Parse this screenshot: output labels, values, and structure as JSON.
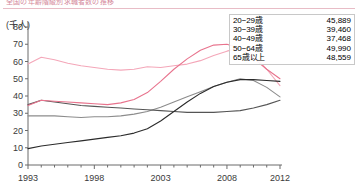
{
  "header": {
    "clipped_text": "全国の年齢階級別求職者数の推移",
    "unit_label": "(千人)"
  },
  "legend": {
    "rows": [
      {
        "label": "20−29歳",
        "value": "45,889",
        "color": "#f4a7b9"
      },
      {
        "label": "30−39歳",
        "value": "39,460",
        "color": "#8c8c8c"
      },
      {
        "label": "40−49歳",
        "value": "37,468",
        "color": "#555555"
      },
      {
        "label": "50−64歳",
        "value": "49,990",
        "color": "#e8738d"
      },
      {
        "label": "65歳以上",
        "value": "48,559",
        "color": "#2b2b2b"
      }
    ]
  },
  "chart_data": {
    "type": "line",
    "title": "",
    "xlabel": "",
    "ylabel": "(千人)",
    "ylim": [
      0,
      80
    ],
    "xlim": [
      1993,
      2012
    ],
    "ytick_values": [
      0,
      10,
      20,
      30,
      40,
      50,
      60,
      70,
      80
    ],
    "ytick_labels": [
      "0",
      "10",
      "20",
      "30",
      "40",
      "50",
      "60",
      "70",
      "80"
    ],
    "xtick_values": [
      1993,
      1998,
      2003,
      2008,
      2012
    ],
    "xtick_labels": [
      "1993",
      "1998",
      "2003",
      "2008",
      "2012"
    ],
    "minor_xticks_every": 1,
    "grid": false,
    "legend_position": "top-right",
    "x": [
      1993,
      1994,
      1995,
      1996,
      1997,
      1998,
      1999,
      2000,
      2001,
      2002,
      2003,
      2004,
      2005,
      2006,
      2007,
      2008,
      2009,
      2010,
      2011,
      2012
    ],
    "series": [
      {
        "name": "20−29歳",
        "color": "#f4a7b9",
        "final_value_label": "45,889",
        "values": [
          58.5,
          62.5,
          61.0,
          59.0,
          57.5,
          56.5,
          55.5,
          55.0,
          55.5,
          57.0,
          56.5,
          57.5,
          58.5,
          60.5,
          63.5,
          66.0,
          68.0,
          64.0,
          55.5,
          46.0
        ]
      },
      {
        "name": "30−39歳",
        "color": "#8c8c8c",
        "final_value_label": "39,460",
        "values": [
          28.5,
          28.5,
          28.5,
          28.0,
          27.5,
          28.0,
          28.0,
          28.5,
          29.5,
          31.0,
          33.5,
          36.5,
          39.5,
          42.5,
          45.5,
          48.0,
          50.0,
          49.0,
          45.0,
          39.5
        ]
      },
      {
        "name": "40−49歳",
        "color": "#555555",
        "final_value_label": "37,468",
        "values": [
          35.0,
          37.5,
          36.5,
          35.5,
          34.5,
          34.0,
          33.5,
          33.0,
          32.5,
          32.0,
          31.5,
          31.0,
          30.5,
          30.5,
          30.5,
          31.0,
          31.5,
          33.0,
          35.0,
          37.5
        ]
      },
      {
        "name": "50−64歳",
        "color": "#e8738d",
        "final_value_label": "49,990",
        "values": [
          34.5,
          37.5,
          37.0,
          36.5,
          36.0,
          35.5,
          35.0,
          36.0,
          38.0,
          42.0,
          48.5,
          55.5,
          61.5,
          66.5,
          69.5,
          70.0,
          67.5,
          62.0,
          55.5,
          50.0
        ]
      },
      {
        "name": "65歳以上",
        "color": "#2b2b2b",
        "final_value_label": "48,559",
        "values": [
          9.5,
          11.0,
          12.0,
          13.0,
          14.0,
          15.0,
          16.0,
          17.0,
          18.5,
          21.0,
          25.5,
          31.0,
          36.5,
          41.5,
          45.5,
          48.0,
          49.5,
          49.5,
          49.0,
          48.5
        ]
      }
    ]
  }
}
